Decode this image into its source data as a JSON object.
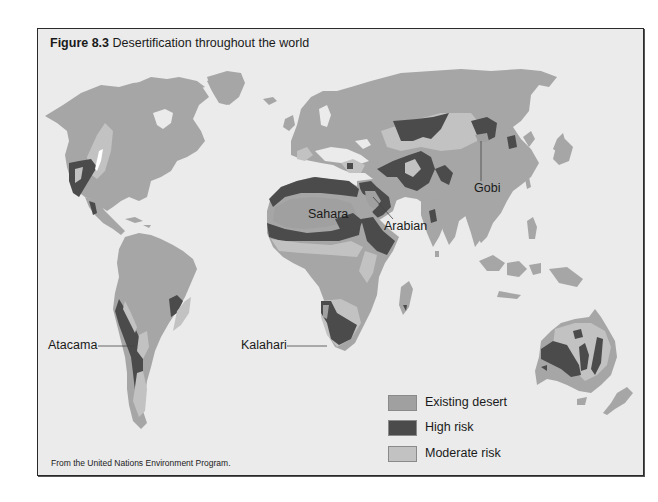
{
  "figure": {
    "number": "Figure 8.3",
    "title": "Desertification throughout the world",
    "source": "From the United Nations Environment Program."
  },
  "colors": {
    "background": "#ebebeb",
    "ocean": "#ebebeb",
    "land_base": "#a6a6a6",
    "existing_desert": "#a0a0a0",
    "high_risk": "#4b4b4b",
    "moderate_risk": "#c2c2c2",
    "frame_border": "#2a2a2a"
  },
  "labels": {
    "sahara": "Sahara",
    "arabian": "Arabian",
    "gobi": "Gobi",
    "atacama": "Atacama",
    "kalahari": "Kalahari"
  },
  "legend": [
    {
      "key": "existing_desert",
      "label": "Existing desert",
      "color": "#a0a0a0"
    },
    {
      "key": "high_risk",
      "label": "High risk",
      "color": "#4b4b4b"
    },
    {
      "key": "moderate_risk",
      "label": "Moderate risk",
      "color": "#c2c2c2"
    }
  ]
}
